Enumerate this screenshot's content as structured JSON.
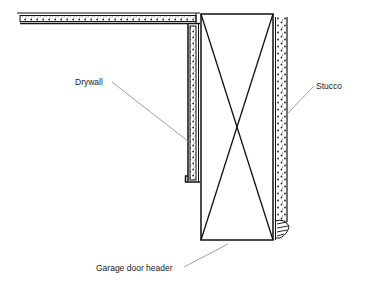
{
  "diagram": {
    "type": "construction-section-detail",
    "labels": {
      "drywall": "Drywall",
      "stucco": "Stucco",
      "header": "Garage door header"
    },
    "colors": {
      "line": "#111111",
      "leader": "#777777",
      "background": "#ffffff"
    }
  }
}
